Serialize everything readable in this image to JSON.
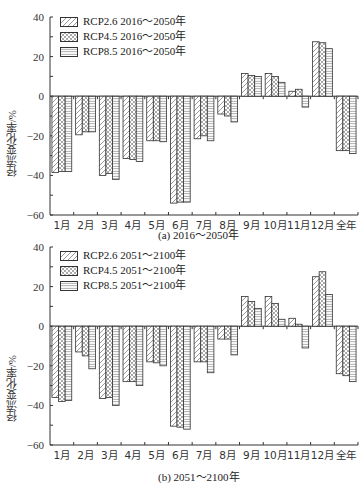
{
  "chart_data": [
    {
      "type": "bar",
      "title": "(a) 2016~2050年",
      "xlabel": "",
      "ylabel": "径流变化率/%",
      "ylim": [
        -60,
        40
      ],
      "yticks": [
        40,
        20,
        0,
        -20,
        -40,
        -60
      ],
      "grid": false,
      "legend_position": "upper left",
      "categories": [
        "1月",
        "2月",
        "3月",
        "4月",
        "5月",
        "6月",
        "7月",
        "8月",
        "9月",
        "10月",
        "11月",
        "12月",
        "全年"
      ],
      "series": [
        {
          "name": "RCP2.6 2016～2050年",
          "pattern": "diagonal",
          "values": [
            -38.5,
            -19.5,
            -40,
            -31.5,
            -22.5,
            -54,
            -21.5,
            -9,
            11.5,
            11.5,
            2.5,
            27.5,
            -27.5
          ]
        },
        {
          "name": "RCP4.5 2016～2050年",
          "pattern": "crosshatch",
          "values": [
            -38,
            -18,
            -39,
            -32,
            -22.5,
            -53.5,
            -20,
            -10,
            10.5,
            10,
            3.5,
            27,
            -27.5
          ]
        },
        {
          "name": "RCP8.5 2016～2050年",
          "pattern": "horizontal",
          "values": [
            -38,
            -18,
            -42,
            -33,
            -23,
            -53.5,
            -22.5,
            -13,
            10,
            7,
            -5.5,
            24,
            -29
          ]
        }
      ]
    },
    {
      "type": "bar",
      "title": "(b) 2051~2100年",
      "xlabel": "",
      "ylabel": "径流变化率/%",
      "ylim": [
        -60,
        40
      ],
      "yticks": [
        40,
        20,
        0,
        -20,
        -40,
        -60
      ],
      "grid": false,
      "legend_position": "upper left",
      "categories": [
        "1月",
        "2月",
        "3月",
        "4月",
        "5月",
        "6月",
        "7月",
        "8月",
        "9月",
        "10月",
        "11月",
        "12月",
        "全年"
      ],
      "series": [
        {
          "name": "RCP2.6 2051～2100年",
          "pattern": "diagonal",
          "values": [
            -36,
            -13,
            -36.5,
            -28,
            -18,
            -50.5,
            -18,
            -6.5,
            15,
            15,
            4,
            25,
            -24
          ]
        },
        {
          "name": "RCP4.5 2051～2100年",
          "pattern": "crosshatch",
          "values": [
            -38,
            -15,
            -36,
            -28,
            -18.5,
            -51,
            -18,
            -6.5,
            12.5,
            11.5,
            1,
            27.5,
            -25
          ]
        },
        {
          "name": "RCP8.5 2051～2100年",
          "pattern": "horizontal",
          "values": [
            -37.5,
            -21.5,
            -40,
            -30,
            -20,
            -52,
            -23.5,
            -14.5,
            9,
            3.5,
            -11,
            16,
            -28
          ]
        }
      ]
    }
  ],
  "panels": {
    "a": {
      "caption": "(a) 2016～2050年",
      "ylabel": "径流变化率/%",
      "legend": [
        "RCP2.6 2016～2050年",
        "RCP4.5 2016～2050年",
        "RCP8.5 2016～2050年"
      ]
    },
    "b": {
      "caption": "(b) 2051～2100年",
      "ylabel": "径流变化率/%",
      "legend": [
        "RCP2.6 2051～2100年",
        "RCP4.5 2051～2100年",
        "RCP8.5 2051～2100年"
      ]
    }
  }
}
